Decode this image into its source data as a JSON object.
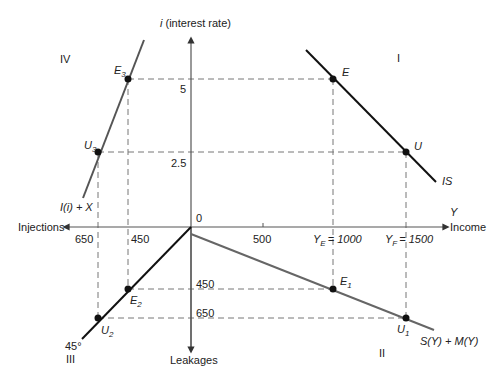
{
  "axes": {
    "vertical_top_label_prefix": "i",
    "vertical_top_label": " (interest rate)",
    "vertical_bottom_label": "Leakages",
    "horizontal_left_label": "Injections",
    "horizontal_right_label_var": "Y",
    "horizontal_right_label": "Income",
    "origin_label": "0"
  },
  "quadrants": {
    "q1": "I",
    "q2": "II",
    "q3": "III",
    "q4": "IV"
  },
  "ticks": {
    "i_5": "5",
    "i_2_5": "2.5",
    "y_500": "500",
    "y_E": "= 1000",
    "y_E_var": "Y",
    "y_E_sub": "E",
    "y_F": "= 1500",
    "y_F_var": "Y",
    "y_F_sub": "F",
    "inj_650": "650",
    "inj_450": "450",
    "leak_450": "450",
    "leak_650": "650"
  },
  "curves": {
    "is": "IS",
    "savings_imports": "S(Y) + M(Y)",
    "investment_exports": "I(i) + X",
    "angle_45": "45°"
  },
  "points": {
    "E": "E",
    "U": "U",
    "E1": {
      "var": "E",
      "sub": "1"
    },
    "U1": {
      "var": "U",
      "sub": "1"
    },
    "E2": {
      "var": "E",
      "sub": "2"
    },
    "U2": {
      "var": "U",
      "sub": "2"
    },
    "E3": {
      "var": "E",
      "sub": "3"
    },
    "U3": {
      "var": "U",
      "sub": "3"
    }
  },
  "colors": {
    "axis": "#555555",
    "curve": "#111111",
    "grey_curve": "#666666",
    "dash": "#777777"
  }
}
